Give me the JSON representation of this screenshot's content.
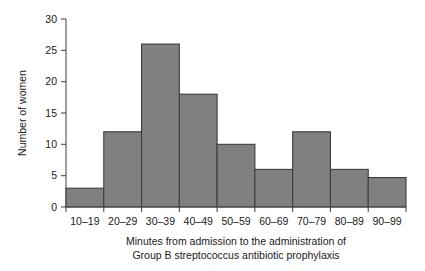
{
  "chart_data": {
    "type": "bar",
    "title": "",
    "subtitle": "",
    "xlabel_line1": "Minutes from admission to the administration of",
    "xlabel_line2": "Group B streptococcus antibiotic prophylaxis",
    "ylabel": "Number of women",
    "categories": [
      "10–19",
      "20–29",
      "30–39",
      "40–49",
      "50–59",
      "60–69",
      "70–79",
      "80–89",
      "90–99"
    ],
    "values": [
      3,
      12,
      26,
      18,
      10,
      6,
      12,
      6,
      4.7
    ],
    "ylim": [
      0,
      30
    ],
    "ytick_labels": [
      "0",
      "5",
      "10",
      "15",
      "20",
      "25",
      "30"
    ],
    "ytick_values": [
      0,
      5,
      10,
      15,
      20,
      25,
      30
    ],
    "grid": false,
    "legend": null,
    "bar_fill": "#808080",
    "bar_stroke": "#3d3d3d",
    "axis_color": "#4d4d4d"
  }
}
